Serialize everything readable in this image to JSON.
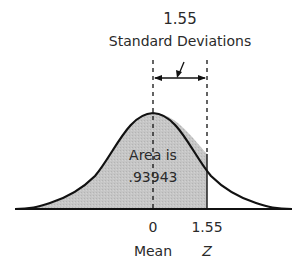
{
  "title": {
    "value": "1.55",
    "unit": "Standard Deviations"
  },
  "shaded_area": {
    "line1": "Area is",
    "line2": ".93943",
    "fill_color": "#c4c4c4"
  },
  "axis": {
    "mean_value": "0",
    "mean_label": "Mean",
    "z_value": "1.55",
    "z_label": "Z"
  },
  "colors": {
    "curve": "#111111",
    "shade": "#c4c4c4",
    "text": "#2a2a2a"
  }
}
